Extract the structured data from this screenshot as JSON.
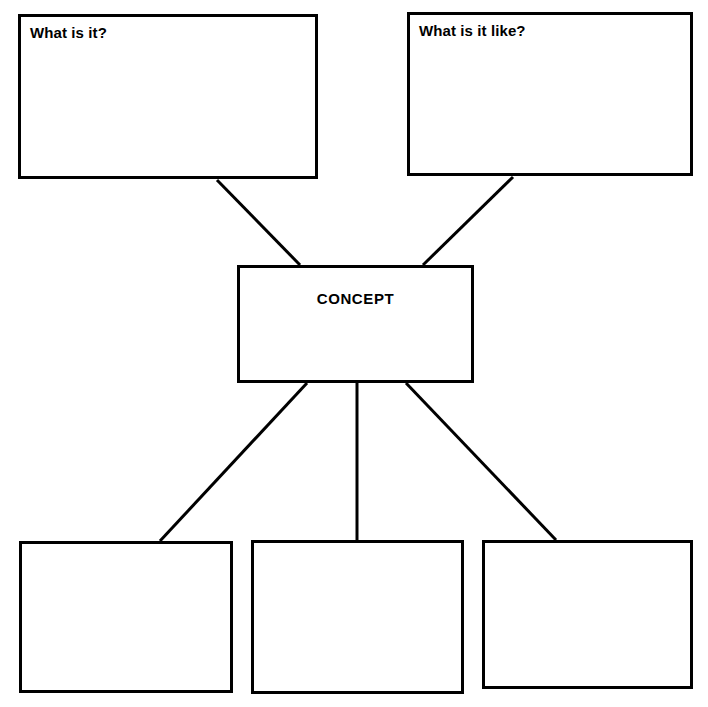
{
  "diagram": {
    "type": "concept-map",
    "nodes": {
      "question_what_is_it": {
        "label": "What is it?",
        "x": 18,
        "y": 14,
        "w": 300,
        "h": 165
      },
      "question_what_is_it_like": {
        "label": "What is it like?",
        "x": 407,
        "y": 12,
        "w": 286,
        "h": 164
      },
      "concept": {
        "label": "CONCEPT",
        "x": 237,
        "y": 265,
        "w": 237,
        "h": 118
      },
      "example_one": {
        "label": "",
        "x": 19,
        "y": 541,
        "w": 214,
        "h": 152
      },
      "example_two": {
        "label": "",
        "x": 251,
        "y": 540,
        "w": 213,
        "h": 154
      },
      "example_three": {
        "label": "",
        "x": 482,
        "y": 540,
        "w": 211,
        "h": 149
      }
    },
    "connectors": [
      {
        "name": "concept-to-what-is-it",
        "x1": 300,
        "y1": 265,
        "x2": 217,
        "y2": 180
      },
      {
        "name": "concept-to-what-is-it-like",
        "x1": 423,
        "y1": 265,
        "x2": 513,
        "y2": 177
      },
      {
        "name": "concept-to-example-one",
        "x1": 307,
        "y1": 383,
        "x2": 160,
        "y2": 541
      },
      {
        "name": "concept-to-example-two",
        "x1": 357,
        "y1": 383,
        "x2": 357,
        "y2": 540
      },
      {
        "name": "concept-to-example-three",
        "x1": 406,
        "y1": 383,
        "x2": 556,
        "y2": 540
      }
    ],
    "colors": {
      "stroke": "#000000",
      "fill": "#ffffff",
      "text": "#000000"
    },
    "stroke_width": 3
  }
}
